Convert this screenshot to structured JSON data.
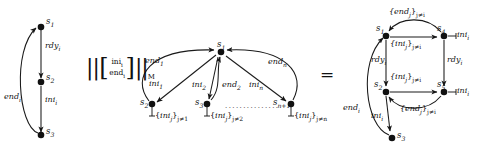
{
  "figure": {
    "type": "automata-composition-diagram",
    "operator_middle": "||[ ini_i / end_i ]||_M",
    "operator_right": "=",
    "colors": {
      "ink": "#111111",
      "node": "#111111",
      "edge": "#222222",
      "paper": "#ffffff"
    }
  },
  "left_automaton": {
    "name": "left-automaton",
    "states": [
      {
        "id": "s1",
        "label": "s",
        "sub": "1"
      },
      {
        "id": "s2",
        "label": "s",
        "sub": "2"
      },
      {
        "id": "s3",
        "label": "s",
        "sub": "3"
      }
    ],
    "transitions": [
      {
        "from": "s1",
        "to": "s2",
        "label": "rdy",
        "sub": "i"
      },
      {
        "from": "s2",
        "to": "s3",
        "label": "ini",
        "sub": "i"
      },
      {
        "from": "s3",
        "to": "s1",
        "label": "end",
        "sub": "i"
      }
    ]
  },
  "operator": {
    "name": "parallel-composition-operator",
    "left_bars": "||",
    "bracket_open": "[",
    "bracket_close": "]",
    "numerator": "ini",
    "numerator_sub": "i",
    "denominator": "end",
    "denominator_sub": "i",
    "right_bars": "||",
    "subscript": "M"
  },
  "middle_automaton": {
    "name": "middle-automaton",
    "states": [
      {
        "id": "c",
        "label": "s",
        "sub": "1"
      },
      {
        "id": "m2",
        "label": "s",
        "sub": "2"
      },
      {
        "id": "m3",
        "label": "s",
        "sub": "3"
      },
      {
        "id": "mn",
        "label": "s",
        "sub": "n+1"
      }
    ],
    "transitions": [
      {
        "from": "c",
        "to": "m2",
        "label": "ini",
        "sub": "1"
      },
      {
        "from": "m2",
        "to": "c",
        "label": "end",
        "sub": "1"
      },
      {
        "from": "c",
        "to": "m3",
        "label": "ini",
        "sub": "2"
      },
      {
        "from": "m3",
        "to": "c",
        "label": "end",
        "sub": "2"
      },
      {
        "from": "c",
        "to": "mn",
        "label": "ini",
        "sub": "n"
      },
      {
        "from": "mn",
        "to": "c",
        "label": "end",
        "sub": "n"
      }
    ],
    "self_loops": [
      {
        "at": "m2",
        "set": "ini",
        "set_sub": "j",
        "cond": "j≠1"
      },
      {
        "at": "m3",
        "set": "ini",
        "set_sub": "j",
        "cond": "j≠2"
      },
      {
        "at": "mn",
        "set": "ini",
        "set_sub": "j",
        "cond": "j≠n"
      }
    ],
    "ellipsis": "..............."
  },
  "right_automaton": {
    "name": "right-automaton",
    "states": [
      {
        "id": "r1",
        "label": "s",
        "sub": "1"
      },
      {
        "id": "r2",
        "label": "s",
        "sub": "2"
      },
      {
        "id": "r3",
        "label": "s",
        "sub": "3"
      },
      {
        "id": "r4",
        "label": "s",
        "sub": "4"
      },
      {
        "id": "r5",
        "label": "s",
        "sub": "5"
      }
    ],
    "transitions": [
      {
        "from": "r1",
        "to": "r4",
        "label": "{ini",
        "sub": "j",
        "cond": "j≠i",
        "pos": "below-top"
      },
      {
        "from": "r4",
        "to": "r1",
        "label": "{end",
        "sub": "j",
        "cond": "j≠i",
        "pos": "top-arc"
      },
      {
        "from": "r1",
        "to": "r2",
        "label": "rdy",
        "sub": "i",
        "pos": "left-vertical"
      },
      {
        "from": "r4",
        "to": "r5",
        "label": "rdy",
        "sub": "i",
        "pos": "right-vertical"
      },
      {
        "from": "r2",
        "to": "r5",
        "label": "{ini",
        "sub": "j",
        "cond": "j≠i",
        "pos": "above-mid"
      },
      {
        "from": "r5",
        "to": "r2",
        "label": "{end",
        "sub": "j",
        "cond": "j≠i",
        "pos": "below-arc"
      },
      {
        "from": "r2",
        "to": "r3",
        "label": "ini",
        "sub": "i",
        "pos": "bottom-vertical"
      },
      {
        "from": "r3",
        "to": "r1",
        "label": "end",
        "sub": "i",
        "pos": "left-arc"
      }
    ],
    "self_loops": [
      {
        "at": "r4",
        "label": "ini",
        "sub": "i"
      },
      {
        "at": "r5",
        "label": "ini",
        "sub": "i"
      }
    ]
  }
}
